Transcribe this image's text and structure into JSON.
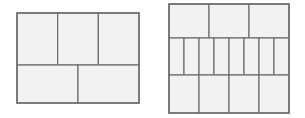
{
  "colors": {
    "background": "#ffffff",
    "panel_fill": "#f2f2f2",
    "line": "#6e6e6e"
  },
  "diagrams": [
    {
      "name": "left-layout",
      "bbox": [
        17,
        13,
        139,
        103
      ],
      "rows": [
        {
          "y0": 13,
          "y1": 65,
          "cells": 3
        },
        {
          "y0": 65,
          "y1": 103,
          "cells": 2
        }
      ]
    },
    {
      "name": "right-layout",
      "bbox": [
        169,
        4,
        289,
        113
      ],
      "rows": [
        {
          "y0": 4,
          "y1": 38,
          "cells": 3
        },
        {
          "y0": 38,
          "y1": 75,
          "cells": 8
        },
        {
          "y0": 75,
          "y1": 113,
          "cells": 4
        }
      ]
    }
  ]
}
